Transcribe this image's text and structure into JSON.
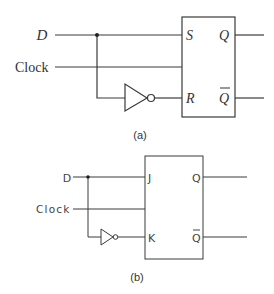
{
  "diagrams": [
    {
      "caption": "(a)",
      "type": "SR flip-flop configured as D flip-flop",
      "inputs": {
        "d": "D",
        "clock": "Clock"
      },
      "pins": {
        "set": "S",
        "reset": "R",
        "q": "Q",
        "q_bar": "Q"
      },
      "components": [
        "junction-dot",
        "inverter",
        "sr-flip-flop-box"
      ]
    },
    {
      "caption": "(b)",
      "type": "JK flip-flop configured as D flip-flop",
      "inputs": {
        "d": "D",
        "clock": "Clock"
      },
      "pins": {
        "j": "J",
        "k": "K",
        "q": "Q",
        "q_bar": "Q"
      },
      "components": [
        "junction-dot",
        "inverter",
        "jk-flip-flop-box"
      ]
    }
  ],
  "colors": {
    "line": "#3a3a3a",
    "background": "#ffffff",
    "text": "#333333"
  }
}
